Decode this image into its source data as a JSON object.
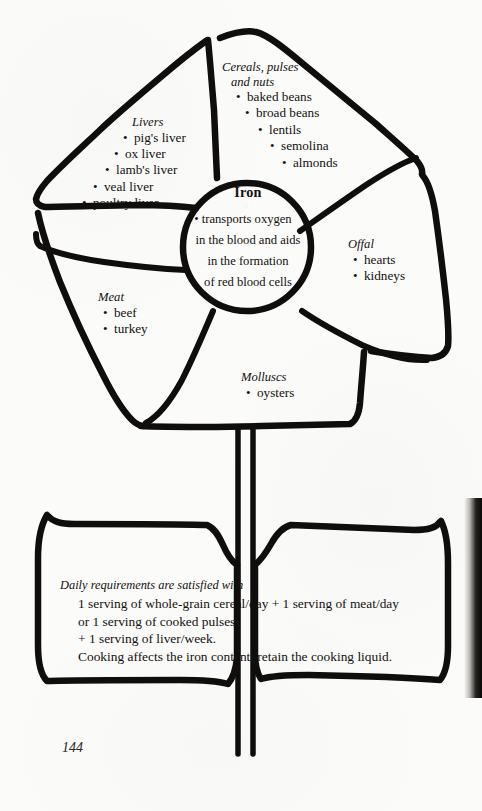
{
  "page": {
    "number": "144",
    "nutrient": "Iron"
  },
  "center": {
    "title": "Iron",
    "bullet": "•",
    "lines": [
      "transports oxygen",
      "in the blood and aids",
      "in the formation",
      "of red blood cells"
    ]
  },
  "petals": [
    {
      "key": "livers",
      "title": "Livers",
      "items": [
        "pig's liver",
        "ox liver",
        "lamb's liver",
        "veal liver",
        "poultry liver"
      ]
    },
    {
      "key": "cereals",
      "title_line1": "Cereals, pulses",
      "title_line2": "and nuts",
      "items": [
        "baked beans",
        "broad beans",
        "lentils",
        "semolina",
        "almonds"
      ]
    },
    {
      "key": "offal",
      "title": "Offal",
      "items": [
        "hearts",
        "kidneys"
      ]
    },
    {
      "key": "meat",
      "title": "Meat",
      "items": [
        "beef",
        "turkey"
      ]
    },
    {
      "key": "molluscs",
      "title": "Molluscs",
      "items": [
        "oysters"
      ]
    }
  ],
  "leaf": {
    "heading": "Daily requirements are satisfied with",
    "lines": [
      "1 serving of whole-grain cereal/day + 1 serving of meat/day",
      "or 1 serving of cooked pulses",
      "+ 1 serving of liver/week.",
      "Cooking affects the iron content: retain the cooking liquid."
    ]
  },
  "bullet": "•",
  "colors": {
    "ink": "#100e0c",
    "paper": "#fbfbfa",
    "gutter": "#0b0a09"
  }
}
